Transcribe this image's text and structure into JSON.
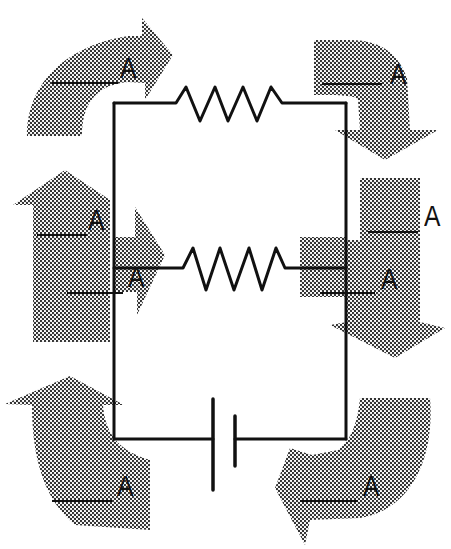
{
  "diagram": {
    "type": "parallel-circuit-current-worksheet",
    "colors": {
      "wire": "#111111",
      "arrow_fill": "#8a8a8a",
      "background": "#ffffff"
    },
    "components": [
      {
        "type": "resistor",
        "position": "top-branch"
      },
      {
        "type": "resistor",
        "position": "middle-branch"
      },
      {
        "type": "battery",
        "position": "bottom-branch"
      }
    ],
    "current_labels": [
      {
        "id": "top-left",
        "unit": "A",
        "value": "",
        "arrow_direction": "right"
      },
      {
        "id": "top-right",
        "unit": "A",
        "value": "",
        "arrow_direction": "down"
      },
      {
        "id": "mid-left-upper",
        "unit": "A",
        "value": "",
        "arrow_direction": "up"
      },
      {
        "id": "mid-left-lower",
        "unit": "A",
        "value": "",
        "arrow_direction": "right"
      },
      {
        "id": "mid-right-upper",
        "unit": "A",
        "value": "",
        "arrow_direction": "down"
      },
      {
        "id": "mid-right-lower",
        "unit": "A",
        "value": "",
        "arrow_direction": "right"
      },
      {
        "id": "bottom-left",
        "unit": "A",
        "value": "",
        "arrow_direction": "up"
      },
      {
        "id": "bottom-right",
        "unit": "A",
        "value": "",
        "arrow_direction": "left"
      }
    ]
  }
}
